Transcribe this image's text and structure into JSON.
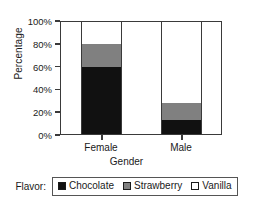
{
  "chart_data": {
    "type": "bar",
    "subtype": "stacked-100-percent",
    "title": "",
    "xlabel": "Gender",
    "ylabel": "Percentage",
    "categories": [
      "Female",
      "Male"
    ],
    "ylim": [
      0,
      100
    ],
    "ytick_values": [
      0,
      20,
      40,
      60,
      80,
      100
    ],
    "ytick_labels": [
      "0%",
      "20%",
      "40%",
      "60%",
      "80%",
      "100%"
    ],
    "grid": false,
    "legend_position": "bottom",
    "legend_title": "Flavor:",
    "series": [
      {
        "name": "Chocolate",
        "color": "#111111",
        "values": [
          60,
          13
        ]
      },
      {
        "name": "Strawberry",
        "color": "#808080",
        "values": [
          20,
          15
        ]
      },
      {
        "name": "Vanilla",
        "color": "#ffffff",
        "values": [
          20,
          72
        ]
      }
    ]
  },
  "axes": {
    "y_title": "Percentage",
    "x_title": "Gender",
    "y_ticks": [
      "100%",
      "80%",
      "60%",
      "40%",
      "20%",
      "0%"
    ],
    "x_ticks": [
      "Female",
      "Male"
    ]
  },
  "legend": {
    "title": "Flavor:",
    "items": [
      {
        "label": "Chocolate",
        "swatch": "#111111"
      },
      {
        "label": "Strawberry",
        "swatch": "#808080"
      },
      {
        "label": "Vanilla",
        "swatch": "#ffffff"
      }
    ]
  }
}
